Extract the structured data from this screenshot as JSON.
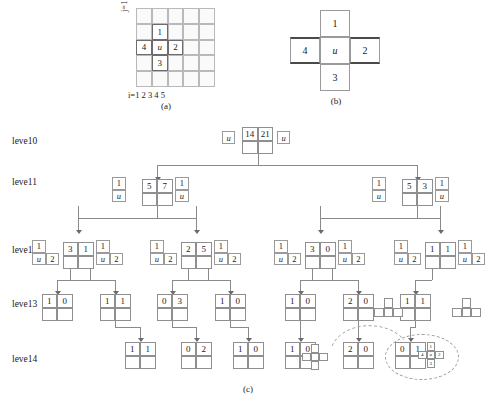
{
  "panel_a": {
    "caption": "(a)",
    "x_axis_label": "i=1 2 3 4 5",
    "y_axis_label": "j=1 2 3 4 5",
    "grid_size": 5,
    "highlighted": [
      {
        "col": 2,
        "row": 2,
        "label": "1"
      },
      {
        "col": 1,
        "row": 3,
        "label": "4"
      },
      {
        "col": 2,
        "row": 3,
        "label": "u"
      },
      {
        "col": 3,
        "row": 3,
        "label": "2"
      },
      {
        "col": 2,
        "row": 4,
        "label": "3"
      }
    ]
  },
  "panel_b": {
    "caption": "(b)",
    "cells": {
      "top": "1",
      "left": "4",
      "center": "u",
      "right": "2",
      "bottom": "3"
    }
  },
  "panel_c": {
    "caption": "(c)",
    "levels": [
      "leve10",
      "leve11",
      "leve12",
      "leve13",
      "leve14"
    ],
    "level0": {
      "node": [
        "14",
        "21",
        "",
        ""
      ],
      "left_chip": "u",
      "right_chip": "u"
    },
    "level1": [
      {
        "node": [
          "5",
          "7",
          "",
          ""
        ],
        "left_box": [
          "1",
          "u",
          ""
        ],
        "right_box": [
          "1",
          "u",
          ""
        ]
      },
      {
        "node": [
          "5",
          "3",
          "",
          ""
        ],
        "left_box": [
          "1",
          "u",
          ""
        ],
        "right_box": [
          "1",
          "u",
          ""
        ]
      }
    ],
    "level2": [
      {
        "node": [
          "3",
          "1",
          "",
          ""
        ],
        "left_box": [
          "1",
          "u",
          "2"
        ],
        "right_box": [
          "1",
          "u",
          "2"
        ]
      },
      {
        "node": [
          "2",
          "5",
          "",
          ""
        ],
        "left_box": [
          "1",
          "u",
          "2"
        ],
        "right_box": [
          "1",
          "u",
          "2"
        ]
      },
      {
        "node": [
          "3",
          "0",
          "",
          ""
        ],
        "left_box": [
          "1",
          "u",
          "2"
        ],
        "right_box": [
          "1",
          "u",
          "2"
        ]
      },
      {
        "node": [
          "1",
          "1",
          "",
          ""
        ],
        "left_box": [
          "1",
          "u",
          "2"
        ],
        "right_box": [
          "1",
          "u",
          "2"
        ]
      }
    ],
    "level3": [
      {
        "node": [
          "1",
          "0",
          "",
          ""
        ]
      },
      {
        "node": [
          "1",
          "1",
          "",
          ""
        ]
      },
      {
        "node": [
          "0",
          "3",
          "",
          ""
        ]
      },
      {
        "node": [
          "1",
          "0",
          "",
          ""
        ]
      },
      {
        "node": [
          "1",
          "0",
          "",
          ""
        ]
      },
      {
        "node": [
          "2",
          "0",
          "",
          ""
        ]
      },
      {
        "node": [
          "1",
          "1",
          "",
          ""
        ]
      }
    ],
    "level3_shapes": [
      "t-tetromino",
      "t-tetromino"
    ],
    "level4": [
      {
        "node": [
          "1",
          "1",
          "",
          ""
        ]
      },
      {
        "node": [
          "0",
          "2",
          "",
          ""
        ]
      },
      {
        "node": [
          "1",
          "0",
          "",
          ""
        ]
      },
      {
        "node": [
          "1",
          "0",
          "",
          ""
        ]
      },
      {
        "node": [
          "2",
          "0",
          "",
          ""
        ]
      },
      {
        "node": [
          "0",
          "1",
          "",
          ""
        ]
      }
    ],
    "level4_shapes": [
      "plus",
      "plus-labeled"
    ],
    "highlight_shape_labels": {
      "top": "1",
      "left": "4",
      "center": "u",
      "right": "2",
      "bottom": "3"
    }
  }
}
